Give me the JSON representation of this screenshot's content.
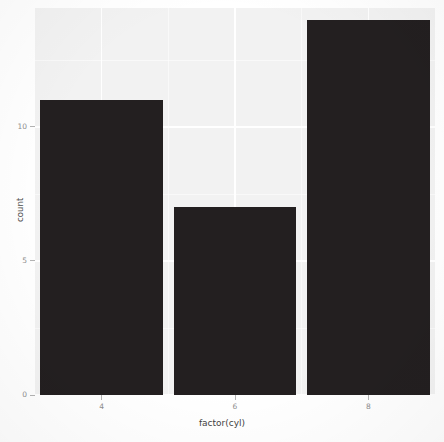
{
  "chart_data": {
    "type": "bar",
    "title": "",
    "subtitle": "",
    "xlabel": "factor(cyl)",
    "ylabel": "count",
    "categories": [
      "4",
      "6",
      "8"
    ],
    "values": [
      11,
      7,
      14
    ],
    "series": [
      {
        "name": "count",
        "values": [
          11,
          7,
          14
        ]
      }
    ],
    "x_tick_labels": [
      "4",
      "6",
      "8"
    ],
    "y_tick_labels": [
      "0",
      "5",
      "10"
    ],
    "y_ticks": [
      0,
      5,
      10
    ],
    "ylim": [
      0,
      14.44
    ],
    "xlim": [
      0.4,
      3.6
    ],
    "grid": true,
    "grid_major_color": "#ffffff",
    "grid_minor_color": "#ffffff",
    "legend": "none",
    "legend_position": "none",
    "bar_color": "#231f20",
    "panel_background": "#f2f2f2",
    "plot_background": "#ffffff",
    "axis_text_color": "#8e8e8e",
    "axis_title_color": "#4d4d4d"
  },
  "axes": {
    "y": {
      "title": "count",
      "ticks": [
        {
          "label": "0",
          "value": 0
        },
        {
          "label": "5",
          "value": 5
        },
        {
          "label": "10",
          "value": 10
        }
      ]
    },
    "x": {
      "title": "factor(cyl)",
      "ticks": [
        {
          "label": "4"
        },
        {
          "label": "6"
        },
        {
          "label": "8"
        }
      ]
    }
  }
}
